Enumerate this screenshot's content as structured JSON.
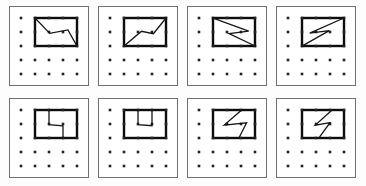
{
  "figure": {
    "colors": {
      "page_background": "#fdfdfd",
      "panel_background": "#ffffff",
      "panel_border": "#6f6f6f",
      "dot": "#222222",
      "rectangle": "#0d0d0d",
      "path": "#161616"
    },
    "panel": {
      "size": 80,
      "border_width": 1
    },
    "grid": {
      "cols": 5,
      "rows": 5,
      "spacing": 14,
      "origin_x": 12,
      "origin_y": 12,
      "dot_size": 2.6
    },
    "inner_rect": {
      "col0": 1,
      "row0": 0,
      "col1": 4,
      "row1": 2,
      "stroke_width": 2.4
    },
    "path_stroke_width": 1.3,
    "panels": [
      {
        "id": "panel-1",
        "shape": "wave-descending-tl-to-br",
        "path": [
          [
            1,
            0
          ],
          [
            2.05,
            1.1
          ],
          [
            3.35,
            0.85
          ],
          [
            4,
            2
          ]
        ]
      },
      {
        "id": "panel-2",
        "shape": "wave-ascending-bl-to-tr",
        "path": [
          [
            1,
            2
          ],
          [
            2.25,
            0.95
          ],
          [
            3.1,
            1.12
          ],
          [
            4,
            0
          ]
        ]
      },
      {
        "id": "panel-3",
        "shape": "z-beak-pointing-right",
        "path": [
          [
            1,
            0
          ],
          [
            3.55,
            0.93
          ],
          [
            2.15,
            1.12
          ],
          [
            4,
            2
          ]
        ]
      },
      {
        "id": "panel-4",
        "shape": "s-lightning-horizontal",
        "path": [
          [
            4,
            0
          ],
          [
            1.55,
            1.08
          ],
          [
            2.95,
            0.9
          ],
          [
            1,
            2
          ]
        ]
      },
      {
        "id": "panel-5",
        "shape": "step-cut-top-to-bottom",
        "path": [
          [
            2,
            0
          ],
          [
            2,
            1.04
          ],
          [
            3,
            1.14
          ],
          [
            3,
            2
          ]
        ]
      },
      {
        "id": "panel-6",
        "shape": "u-notch-hanging-from-top",
        "path": [
          [
            2,
            0
          ],
          [
            2,
            1.04
          ],
          [
            3,
            1.12
          ],
          [
            3,
            0
          ]
        ]
      },
      {
        "id": "panel-7",
        "shape": "z-beak-pointing-left",
        "path": [
          [
            3.05,
            0
          ],
          [
            1.8,
            1.08
          ],
          [
            3.4,
            0.92
          ],
          [
            2.85,
            2
          ]
        ]
      },
      {
        "id": "panel-8",
        "shape": "s-lightning-steep",
        "path": [
          [
            3.15,
            0
          ],
          [
            1.95,
            1.08
          ],
          [
            3.0,
            0.9
          ],
          [
            2.2,
            2
          ]
        ]
      }
    ]
  }
}
